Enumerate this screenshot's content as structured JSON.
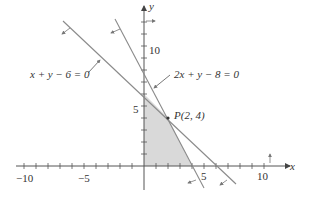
{
  "diagram": {
    "type": "linear-inequality-feasible-region",
    "axes": {
      "x_label": "x",
      "y_label": "y",
      "x_ticks_labeled": [
        "−10",
        "−5",
        "5",
        "10"
      ],
      "y_ticks_labeled": [
        "5",
        "10"
      ]
    },
    "lines": [
      {
        "equation": "x + y − 6 = 0",
        "x_intercept": 6,
        "y_intercept": 6
      },
      {
        "equation": "2x + y − 8 = 0",
        "x_intercept": 4,
        "y_intercept": 8
      }
    ],
    "point": {
      "label": "P(2, 4)",
      "x": 2,
      "y": 4
    },
    "shaded_region": {
      "description": "Feasible region bounded by axes and both lines",
      "vertices": [
        [
          0,
          0
        ],
        [
          4,
          0
        ],
        [
          2,
          4
        ],
        [
          0,
          6
        ]
      ],
      "fill": "#d9d9d9"
    },
    "colors": {
      "line": "#8a8a8a",
      "axis": "#555555",
      "shade": "#d9d9d9",
      "text": "#333333"
    }
  }
}
